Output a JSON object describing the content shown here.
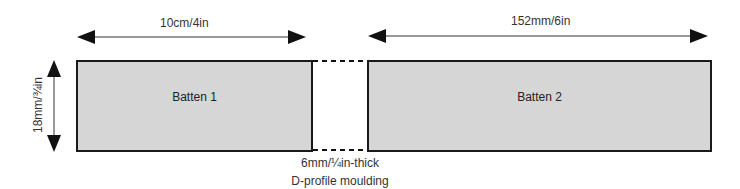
{
  "diagram": {
    "dimensions": {
      "batten1_length": "10cm/4in",
      "batten2_length": "152mm/6in",
      "height": "18mm/¾in"
    },
    "battens": [
      {
        "label": "Batten 1"
      },
      {
        "label": "Batten 2"
      }
    ],
    "gap_note": {
      "line1": "6mm/¼in-thick",
      "line2": "D-profile moulding"
    },
    "colors": {
      "batten_fill": "#d6d6d6",
      "outline": "#1a1a1a"
    }
  }
}
